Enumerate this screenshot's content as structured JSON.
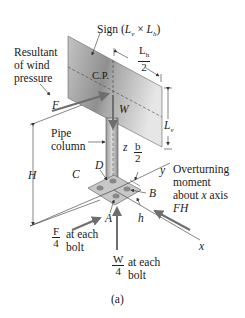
{
  "figure": {
    "caption": "(a)",
    "sign_label": "Sign (Lv × Lh)",
    "sign_label_parts": {
      "prefix": "Sign (",
      "lv": "L",
      "lv_sub": "v",
      "times": " × ",
      "lh": "L",
      "lh_sub": "h",
      "suffix": ")"
    },
    "wind_label_lines": [
      "Resultant",
      "of wind",
      "pressure"
    ],
    "force_F": "F",
    "center_pressure": "C.P.",
    "weight_W": "W",
    "lh_half": {
      "num": "Lh",
      "num_main": "L",
      "num_sub": "h",
      "den": "2"
    },
    "lv_dim": {
      "main": "L",
      "sub": "v"
    },
    "pipe_label_lines": [
      "Pipe",
      "column"
    ],
    "z_axis": "z",
    "b_half": {
      "num": "b",
      "den": "2"
    },
    "height_H": "H",
    "point_C": "C",
    "point_D": "D",
    "point_B": "B",
    "point_A": "A",
    "y_axis": "y",
    "x_axis": "x",
    "dim_h": "h",
    "moment_label_lines": [
      "Overturning",
      "moment",
      "about x axis"
    ],
    "moment_value": "FH",
    "f_bolt": {
      "num": "F",
      "den": "4",
      "text_lines": [
        "at each",
        "bolt"
      ]
    },
    "w_bolt": {
      "num": "W",
      "den": "4",
      "text_lines": [
        "at each",
        "bolt"
      ]
    }
  },
  "colors": {
    "sign_light": "#d9d9d9",
    "sign_dark": "#8c8c8c",
    "arrow": "#6e6e6e",
    "line": "#333333"
  }
}
